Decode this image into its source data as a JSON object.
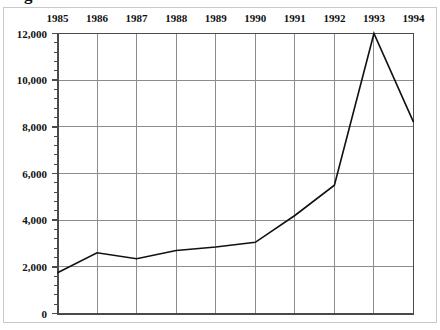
{
  "figure": {
    "width": 440,
    "height": 330,
    "border_color": "#c9c9c9",
    "background": "#ffffff",
    "clipped_title": "Figure"
  },
  "axis_colors": {
    "axis_line": "#4a4a4a",
    "gridline": "#8c8c8c",
    "series_line": "#111111",
    "text": "#111111"
  },
  "chart_data": {
    "type": "line",
    "title": "",
    "xlabel": "",
    "ylabel": "",
    "x": [
      1985,
      1986,
      1987,
      1988,
      1989,
      1990,
      1991,
      1992,
      1993,
      1994
    ],
    "categories": [
      "1985",
      "1986",
      "1987",
      "1988",
      "1989",
      "1990",
      "1991",
      "1992",
      "1993",
      "1994"
    ],
    "values": [
      1750,
      2600,
      2350,
      2700,
      2850,
      3050,
      4200,
      5500,
      12000,
      8200
    ],
    "series": [
      {
        "name": "series-1",
        "values": [
          1750,
          2600,
          2350,
          2700,
          2850,
          3050,
          4200,
          5500,
          12000,
          8200
        ]
      }
    ],
    "ylim": [
      0,
      12000
    ],
    "ytick_values": [
      0,
      2000,
      4000,
      6000,
      8000,
      10000,
      12000
    ],
    "ytick_labels": [
      "0",
      "2,000",
      "4,000",
      "6,000",
      "8,000",
      "10,000",
      "12,000"
    ],
    "minor_ticks_per_interval": 4,
    "xtick_labels": [
      "1985",
      "1986",
      "1987",
      "1988",
      "1989",
      "1990",
      "1991",
      "1992",
      "1993",
      "1994"
    ],
    "xtick_label_position": "top",
    "grid": true,
    "grid_axes": "both",
    "legend": false,
    "legend_position": "none",
    "markers": false
  }
}
